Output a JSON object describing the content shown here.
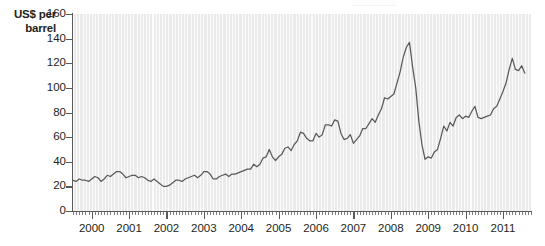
{
  "chart_data": {
    "type": "line",
    "title": "",
    "subtitle": "",
    "xlabel": "",
    "ylabel": "US$ per barrel",
    "ylim": [
      0,
      160
    ],
    "xlim": [
      1999.5,
      2011.75
    ],
    "ytick_labels": [
      "0",
      "20",
      "40",
      "60",
      "80",
      "100",
      "120",
      "140",
      "160"
    ],
    "ytick_values": [
      0,
      20,
      40,
      60,
      80,
      100,
      120,
      140,
      160
    ],
    "xtick_labels": [
      "2000",
      "2001",
      "2002",
      "2003",
      "2004",
      "2005",
      "2006",
      "2007",
      "2008",
      "2009",
      "2010",
      "2011"
    ],
    "xtick_values": [
      2000,
      2001,
      2002,
      2003,
      2004,
      2005,
      2006,
      2007,
      2008,
      2009,
      2010,
      2011
    ],
    "minor_tick_interval_months": 1,
    "grid": "vertical-only",
    "legend": "none",
    "line_color": "#595959",
    "plot_background": "#ebebeb",
    "series": [
      {
        "name": "Crude oil price",
        "x": [
          1999.5,
          1999.583,
          1999.667,
          1999.75,
          1999.833,
          1999.917,
          2000.0,
          2000.083,
          2000.167,
          2000.25,
          2000.333,
          2000.417,
          2000.5,
          2000.583,
          2000.667,
          2000.75,
          2000.833,
          2000.917,
          2001.0,
          2001.083,
          2001.167,
          2001.25,
          2001.333,
          2001.417,
          2001.5,
          2001.583,
          2001.667,
          2001.75,
          2001.833,
          2001.917,
          2002.0,
          2002.083,
          2002.167,
          2002.25,
          2002.333,
          2002.417,
          2002.5,
          2002.583,
          2002.667,
          2002.75,
          2002.833,
          2002.917,
          2003.0,
          2003.083,
          2003.167,
          2003.25,
          2003.333,
          2003.417,
          2003.5,
          2003.583,
          2003.667,
          2003.75,
          2003.833,
          2003.917,
          2004.0,
          2004.083,
          2004.167,
          2004.25,
          2004.333,
          2004.417,
          2004.5,
          2004.583,
          2004.667,
          2004.75,
          2004.833,
          2004.917,
          2005.0,
          2005.083,
          2005.167,
          2005.25,
          2005.333,
          2005.417,
          2005.5,
          2005.583,
          2005.667,
          2005.75,
          2005.833,
          2005.917,
          2006.0,
          2006.083,
          2006.167,
          2006.25,
          2006.333,
          2006.417,
          2006.5,
          2006.583,
          2006.667,
          2006.75,
          2006.833,
          2006.917,
          2007.0,
          2007.083,
          2007.167,
          2007.25,
          2007.333,
          2007.417,
          2007.5,
          2007.583,
          2007.667,
          2007.75,
          2007.833,
          2007.917,
          2008.0,
          2008.083,
          2008.167,
          2008.25,
          2008.333,
          2008.417,
          2008.5,
          2008.583,
          2008.667,
          2008.75,
          2008.833,
          2008.917,
          2009.0,
          2009.083,
          2009.167,
          2009.25,
          2009.333,
          2009.417,
          2009.5,
          2009.583,
          2009.667,
          2009.75,
          2009.833,
          2009.917,
          2010.0,
          2010.083,
          2010.167,
          2010.25,
          2010.333,
          2010.417,
          2010.5,
          2010.583,
          2010.667,
          2010.75,
          2010.833,
          2010.917,
          2011.0,
          2011.083,
          2011.167,
          2011.25,
          2011.333,
          2011.417,
          2011.5,
          2011.583
        ],
        "values": [
          25,
          24,
          26,
          25,
          25,
          24,
          26,
          28,
          27,
          24,
          26,
          29,
          28,
          30,
          32,
          32,
          30,
          27,
          28,
          29,
          29,
          27,
          28,
          27,
          25,
          24,
          26,
          24,
          22,
          20,
          20,
          21,
          23,
          25,
          25,
          24,
          26,
          27,
          28,
          29,
          27,
          29,
          32,
          32,
          30,
          26,
          26,
          28,
          29,
          30,
          28,
          30,
          30,
          31,
          32,
          33,
          34,
          34,
          38,
          36,
          38,
          43,
          44,
          50,
          44,
          41,
          44,
          46,
          51,
          52,
          49,
          54,
          57,
          64,
          63,
          59,
          57,
          57,
          63,
          60,
          62,
          70,
          70,
          69,
          74,
          73,
          63,
          58,
          59,
          62,
          55,
          58,
          61,
          67,
          67,
          71,
          75,
          72,
          78,
          83,
          92,
          91,
          93,
          95,
          104,
          113,
          125,
          133,
          137,
          117,
          100,
          73,
          54,
          42,
          44,
          43,
          48,
          50,
          59,
          69,
          65,
          72,
          69,
          76,
          78,
          75,
          77,
          76,
          81,
          85,
          76,
          75,
          76,
          77,
          78,
          83,
          85,
          91,
          97,
          104,
          115,
          124,
          115,
          114,
          118,
          112
        ]
      }
    ]
  },
  "axis": {
    "y_title": "US$ per barrel"
  }
}
